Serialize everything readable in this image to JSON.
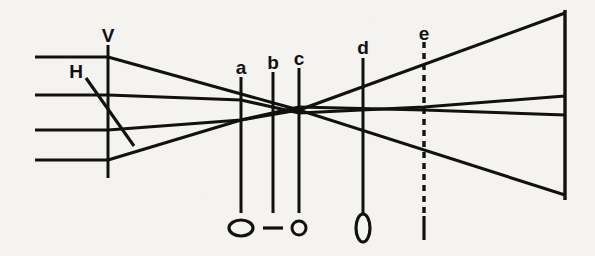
{
  "figure": {
    "background_color": "#f4f3f0",
    "ink_color": "#111111",
    "width": 595,
    "height": 256
  },
  "labels": {
    "vertical_plane": "V",
    "horizontal_plane": "H",
    "plane_a": "a",
    "plane_b": "b",
    "plane_c": "c",
    "plane_d": "d",
    "plane_e": "e"
  },
  "planes": [
    {
      "id": "V",
      "label": "V",
      "x": 108,
      "y_top": 45,
      "y_bottom": 178,
      "style": "solid",
      "label_x": 108,
      "label_y": 42
    },
    {
      "id": "a",
      "label": "a",
      "x": 241,
      "y_top": 77,
      "y_bottom": 213,
      "style": "solid",
      "label_x": 241,
      "label_y": 74
    },
    {
      "id": "b",
      "label": "b",
      "x": 273,
      "y_top": 72,
      "y_bottom": 213,
      "style": "solid",
      "label_x": 273,
      "label_y": 69
    },
    {
      "id": "c",
      "label": "c",
      "x": 299,
      "y_top": 68,
      "y_bottom": 213,
      "style": "solid",
      "label_x": 299,
      "label_y": 65
    },
    {
      "id": "d",
      "label": "d",
      "x": 363,
      "y_top": 58,
      "y_bottom": 215,
      "style": "solid",
      "label_x": 363,
      "label_y": 54
    },
    {
      "id": "e",
      "label": "e",
      "x": 424,
      "y_top": 42,
      "y_bottom": 215,
      "style": "dashed",
      "label_x": 424,
      "label_y": 40
    }
  ],
  "screen": {
    "x": 565,
    "y_top": 10,
    "y_bottom": 200
  },
  "input_rays": [
    {
      "id": "in-1",
      "y": 57,
      "x_start": 35,
      "x_end": 108
    },
    {
      "id": "in-2",
      "y": 95,
      "x_start": 35,
      "x_end": 108
    },
    {
      "id": "in-3",
      "y": 130,
      "x_start": 35,
      "x_end": 108
    },
    {
      "id": "in-4",
      "y": 160,
      "x_start": 35,
      "x_end": 108
    }
  ],
  "ray_paths": [
    {
      "id": "ray-top-steep",
      "points": "108,57 299,110 565,13"
    },
    {
      "id": "ray-upper-shallow",
      "points": "108,95 241,100 299,113 424,107 565,96"
    },
    {
      "id": "ray-lower-shallow",
      "points": "108,130 241,120 299,107 424,110 565,115"
    },
    {
      "id": "ray-bottom-steep",
      "points": "108,160 241,120 299,110 565,195"
    }
  ],
  "h_leader": {
    "x1": 86,
    "y1": 78,
    "x2": 134,
    "y2": 146
  },
  "h_label_pos": {
    "x": 76,
    "y": 78
  },
  "beam_spots": [
    {
      "id": "spot-a",
      "plane": "a",
      "shape": "wide-ellipse",
      "cx": 241,
      "cy": 228,
      "rx": 12,
      "ry": 8,
      "stroke_width": 3.2
    },
    {
      "id": "spot-b",
      "plane": "b",
      "shape": "horizontal-line",
      "cx": 273,
      "cy": 228,
      "rx": 10,
      "ry": 0,
      "stroke_width": 3.2
    },
    {
      "id": "spot-c",
      "plane": "c",
      "shape": "small-circle",
      "cx": 299,
      "cy": 228,
      "rx": 7,
      "ry": 7,
      "stroke_width": 3.0
    },
    {
      "id": "spot-d",
      "plane": "d",
      "shape": "tall-ellipse",
      "cx": 363,
      "cy": 228,
      "rx": 7,
      "ry": 14,
      "stroke_width": 3.2
    },
    {
      "id": "spot-e",
      "plane": "e",
      "shape": "vertical-line",
      "cx": 424,
      "cy": 228,
      "rx": 0,
      "ry": 12,
      "stroke_width": 3.2
    }
  ]
}
